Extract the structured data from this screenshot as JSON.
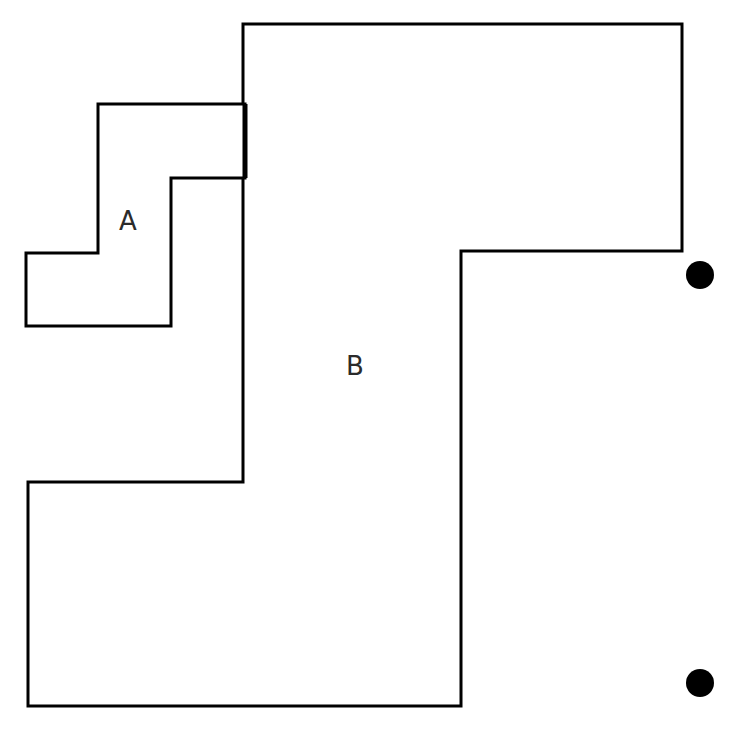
{
  "canvas": {
    "width": 740,
    "height": 738,
    "background_color": "#ffffff"
  },
  "figure": {
    "stroke_color": "#000000",
    "fill_color": "#ffffff",
    "stroke_width": 3,
    "thick_stroke_width": 5,
    "dot_color": "#000000"
  },
  "shapes": [
    {
      "id": "region-b",
      "label": "B",
      "label_x": 355,
      "label_y": 367,
      "points": "243,24 682,24 682,251 461,251 461,706 28,706 28,482 243,482",
      "vertices": [
        [
          243,
          24
        ],
        [
          682,
          24
        ],
        [
          682,
          251
        ],
        [
          461,
          251
        ],
        [
          461,
          706
        ],
        [
          28,
          706
        ],
        [
          28,
          482
        ],
        [
          243,
          482
        ]
      ]
    },
    {
      "id": "region-a",
      "label": "A",
      "label_x": 128,
      "label_y": 222,
      "points": "98,104 245,104 245,178 171,178 171,326 26,326 26,253 98,253",
      "vertices": [
        [
          98,
          104
        ],
        [
          245,
          104
        ],
        [
          245,
          178
        ],
        [
          171,
          178
        ],
        [
          171,
          326
        ],
        [
          26,
          326
        ],
        [
          26,
          253
        ],
        [
          98,
          253
        ]
      ]
    }
  ],
  "emphasis_edge": {
    "id": "shared-edge",
    "x1": 245,
    "y1": 104,
    "x2": 245,
    "y2": 178
  },
  "dots": [
    {
      "id": "dot-upper",
      "cx": 700,
      "cy": 275,
      "r": 14
    },
    {
      "id": "dot-lower",
      "cx": 700,
      "cy": 683,
      "r": 14
    }
  ],
  "labels": {
    "region_a": "A",
    "region_b": "B"
  }
}
